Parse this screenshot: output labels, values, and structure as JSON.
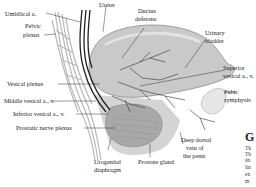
{
  "diagram": {
    "labels": {
      "umbilical": "Umbilical a.",
      "pelvic_plexus_1": "Pelvic",
      "pelvic_plexus_2": "plexus",
      "ureter": "Ureter",
      "ductus_1": "Ductus",
      "ductus_2": "deferens",
      "bladder_1": "Urinary",
      "bladder_2": "bladder",
      "superior_1": "Superior",
      "superior_2": "vesical a., v.",
      "pubic_1": "Pubic",
      "pubic_2": "symphysis",
      "vesical_plexus": "Vesical plexus",
      "middle_vesical": "Middle vesical a., v.",
      "inferior_vesical": "Inferior vesical a., v.",
      "prostatic_nerve": "Prostatic nerve plexus",
      "urogenital_1": "Urogenital",
      "urogenital_2": "diaphragm",
      "prostate": "Prostate gland",
      "deep_dorsal_1": "Deep dorsal",
      "deep_dorsal_2": "vein of",
      "deep_dorsal_3": "the penis"
    },
    "side_text": {
      "heading": "G",
      "lines": [
        "Th",
        "Th",
        "sh",
        "lin",
        "ex",
        "m"
      ]
    }
  }
}
